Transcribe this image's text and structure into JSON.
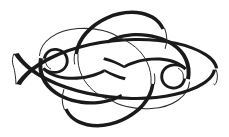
{
  "artwork": {
    "kind": "calligraphic-flourish-ornament",
    "title": "Interlaced double-ellipse flourish with spiral terminals",
    "medium": "pen-and-ink line drawing",
    "canvas": {
      "width": 229,
      "height": 137,
      "unit": "px"
    },
    "background_color": "#ffffff",
    "ink_color": "#1a1a1a",
    "hairline_color": "#2a2a2a",
    "stroke_style": "swelled calligraphic contrast (thick on the diagonal downstrokes, hairline on the upstrokes)",
    "symmetry": "two-fold rotational about the centre point",
    "bounds": {
      "left": 12,
      "top": 10,
      "right": 218,
      "bottom": 128
    },
    "center": {
      "x": 114,
      "y": 69
    },
    "elements": [
      {
        "name": "left-ellipse",
        "role": "large tilted oval occupying the left half",
        "center": {
          "x": 78,
          "y": 68
        },
        "radius_x": 66,
        "radius_y": 40,
        "rotation_deg": -12
      },
      {
        "name": "right-ellipse",
        "role": "large tilted oval occupying the right half",
        "center": {
          "x": 150,
          "y": 69
        },
        "radius_x": 66,
        "radius_y": 40,
        "rotation_deg": -12
      },
      {
        "name": "left-spiral-terminal",
        "role": "inward curl closing the left end of the ribbon",
        "center": {
          "x": 39,
          "y": 69
        },
        "radius": 14,
        "winding": "counter-clockwise"
      },
      {
        "name": "right-spiral-terminal",
        "role": "inward curl closing the right end of the ribbon",
        "center": {
          "x": 189,
          "y": 69
        },
        "radius": 14,
        "winding": "clockwise"
      },
      {
        "name": "upper-diagonal-sweep",
        "role": "long thick stroke rising from lower-left to upper-right through the centre"
      },
      {
        "name": "lower-diagonal-sweep",
        "role": "long thick stroke descending from upper-left to lower-right through the centre"
      }
    ],
    "crossings": [
      {
        "name": "upper-left-crossing",
        "x": 74,
        "y": 36
      },
      {
        "name": "upper-right-crossing",
        "x": 154,
        "y": 36
      },
      {
        "name": "centre-crossing",
        "x": 114,
        "y": 69
      },
      {
        "name": "lower-left-crossing",
        "x": 74,
        "y": 101
      },
      {
        "name": "lower-right-crossing",
        "x": 154,
        "y": 101
      }
    ]
  }
}
